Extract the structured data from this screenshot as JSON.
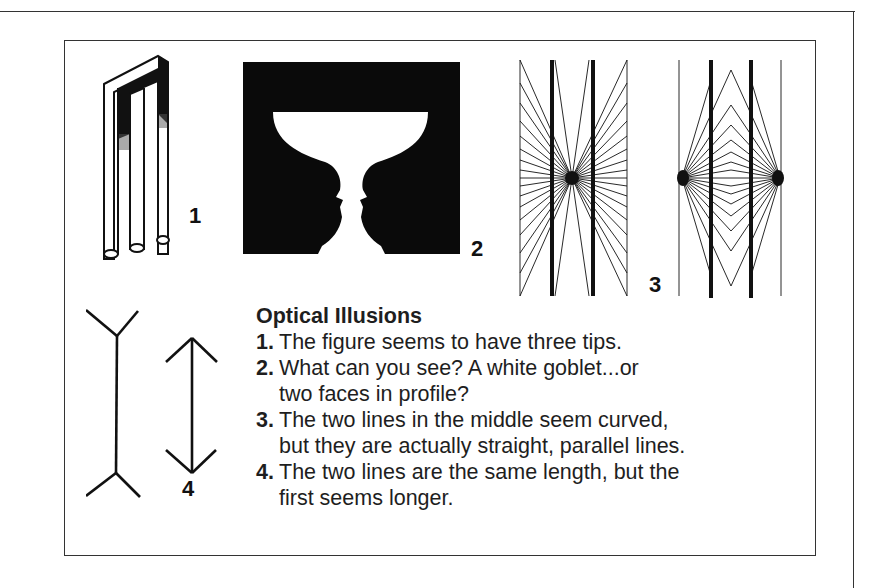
{
  "figures": {
    "fig1": {
      "label": "1",
      "description": "impossible trident (blivet)"
    },
    "fig2": {
      "label": "2",
      "description": "Rubin vase / two faces in profile"
    },
    "fig3": {
      "label": "3",
      "description": "Hering and Wundt illusions"
    },
    "fig4": {
      "label": "4",
      "description": "Müller-Lyer illusion"
    }
  },
  "caption": {
    "heading": "Optical Illusions",
    "items": [
      {
        "number": "1.",
        "lines": [
          "The figure seems to have three tips."
        ]
      },
      {
        "number": "2.",
        "lines": [
          "What can you see? A white goblet...or",
          "two faces in profile?"
        ]
      },
      {
        "number": "3.",
        "lines": [
          "The two lines in the middle seem curved,",
          "but they are actually straight, parallel lines."
        ]
      },
      {
        "number": "4.",
        "lines": [
          "The two lines are the same length, but the",
          "first seems longer."
        ]
      }
    ]
  },
  "colors": {
    "ink": "#111111",
    "border": "#333333",
    "background": "#ffffff"
  }
}
